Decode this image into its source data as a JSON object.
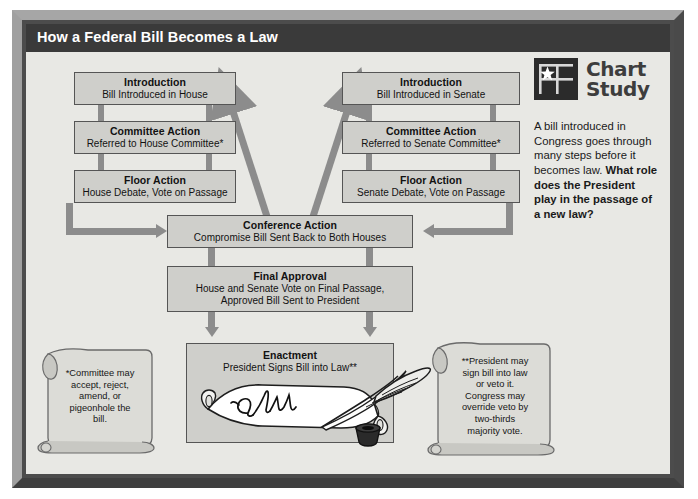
{
  "poster": {
    "title": "How a Federal Bill Becomes a Law"
  },
  "colors": {
    "frame": "#8d8d8d",
    "frame_shadow": "#3f3f3f",
    "titlebar": "#3a3a3a",
    "stage_bg": "#e8e8e4",
    "box_fill": "#cfcfcb",
    "box_border": "#555555",
    "connector": "#8c8c8c",
    "logo_bg": "#2b2b2b"
  },
  "flow": {
    "house": [
      {
        "title": "Introduction",
        "subtitle": "Bill Introduced in House"
      },
      {
        "title": "Committee Action",
        "subtitle": "Referred to House Committee*"
      },
      {
        "title": "Floor Action",
        "subtitle": "House Debate, Vote on Passage"
      }
    ],
    "senate": [
      {
        "title": "Introduction",
        "subtitle": "Bill Introduced in Senate"
      },
      {
        "title": "Committee Action",
        "subtitle": "Referred to Senate Committee*"
      },
      {
        "title": "Floor Action",
        "subtitle": "Senate Debate, Vote on Passage"
      }
    ],
    "conference": {
      "title": "Conference Action",
      "subtitle": "Compromise Bill Sent Back to Both Houses"
    },
    "final_approval": {
      "title": "Final Approval",
      "subtitle_line1": "House and Senate Vote on Final Passage,",
      "subtitle_line2": "Approved Bill Sent to President"
    },
    "enactment": {
      "title": "Enactment",
      "subtitle": "President Signs Bill into Law**"
    }
  },
  "illustration": {
    "scroll_word": "Law",
    "quill_name": "quill-pen",
    "inkwell_name": "inkwell"
  },
  "notes": {
    "left_scroll": "*Committee may accept, reject, amend, or pigeonhole the bill.",
    "left_scroll_lines": [
      "*Committee may",
      "accept, reject,",
      "amend, or",
      "pigeonhole the",
      "bill."
    ],
    "right_scroll": "**President may sign bill into law or veto it. Congress may override veto by two-thirds majority vote.",
    "right_scroll_lines": [
      "**President may",
      "sign bill into law",
      "or veto it.",
      "Congress may",
      "override veto by",
      "two-thirds",
      "majority vote."
    ]
  },
  "chart_study": {
    "heading_line1": "Chart",
    "heading_line2": "Study",
    "logo_icon": "flag-star-icon",
    "paragraph": "A bill introduced in Congress goes through many steps before it becomes law.",
    "question": "What role does the President play in the passage of a new law?"
  }
}
